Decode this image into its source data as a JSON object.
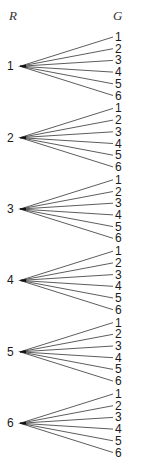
{
  "diagram": {
    "type": "tree",
    "headers": {
      "left": "R",
      "right": "G"
    },
    "roots": [
      {
        "label": "1",
        "children": [
          "1",
          "2",
          "3",
          "4",
          "5",
          "6"
        ]
      },
      {
        "label": "2",
        "children": [
          "1",
          "2",
          "3",
          "4",
          "5",
          "6"
        ]
      },
      {
        "label": "3",
        "children": [
          "1",
          "2",
          "3",
          "4",
          "5",
          "6"
        ]
      },
      {
        "label": "4",
        "children": [
          "1",
          "2",
          "3",
          "4",
          "5",
          "6"
        ]
      },
      {
        "label": "5",
        "children": [
          "1",
          "2",
          "3",
          "4",
          "5",
          "6"
        ]
      },
      {
        "label": "6",
        "children": [
          "1",
          "2",
          "3",
          "4",
          "5",
          "6"
        ]
      }
    ],
    "colors": {
      "line": "#333333",
      "text": "#1a1a1a",
      "background": "#ffffff"
    }
  }
}
